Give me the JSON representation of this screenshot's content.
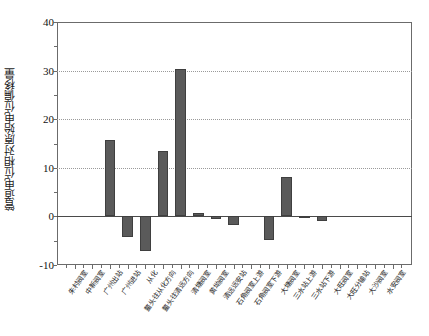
{
  "chart_data": {
    "type": "bar",
    "title": "",
    "xlabel": "",
    "ylabel": "管道电位相对原始电位偏移量",
    "ylim": [
      -10,
      40
    ],
    "yticks": [
      -10,
      0,
      10,
      20,
      30,
      40
    ],
    "ytick_labels": [
      "-10",
      "0",
      "10",
      "20",
      "30",
      "40"
    ],
    "gridlines": [
      10,
      20,
      30
    ],
    "grid": true,
    "legend": "none",
    "bar_color": "#5a5a5a",
    "categories": [
      "朱村阀室",
      "中新阀室",
      "广州出站",
      "广州进站",
      "从化",
      "鳌头往从化方向",
      "鳌头往清远方向",
      "清塘阀室",
      "黄坳阀室",
      "清远远安站",
      "石角阀室上游",
      "石角阀室下游",
      "大塘阀室",
      "三水站上游",
      "三水站下游",
      "大旺阀室",
      "大旺分输站",
      "大沙阀室",
      "水安阀室"
    ],
    "values": [
      0,
      0,
      15.7,
      -4.2,
      -7.2,
      13.4,
      30.4,
      0.6,
      -0.5,
      -1.7,
      0,
      -4.8,
      8.2,
      -0.4,
      -0.9,
      0,
      0,
      0,
      0
    ]
  }
}
